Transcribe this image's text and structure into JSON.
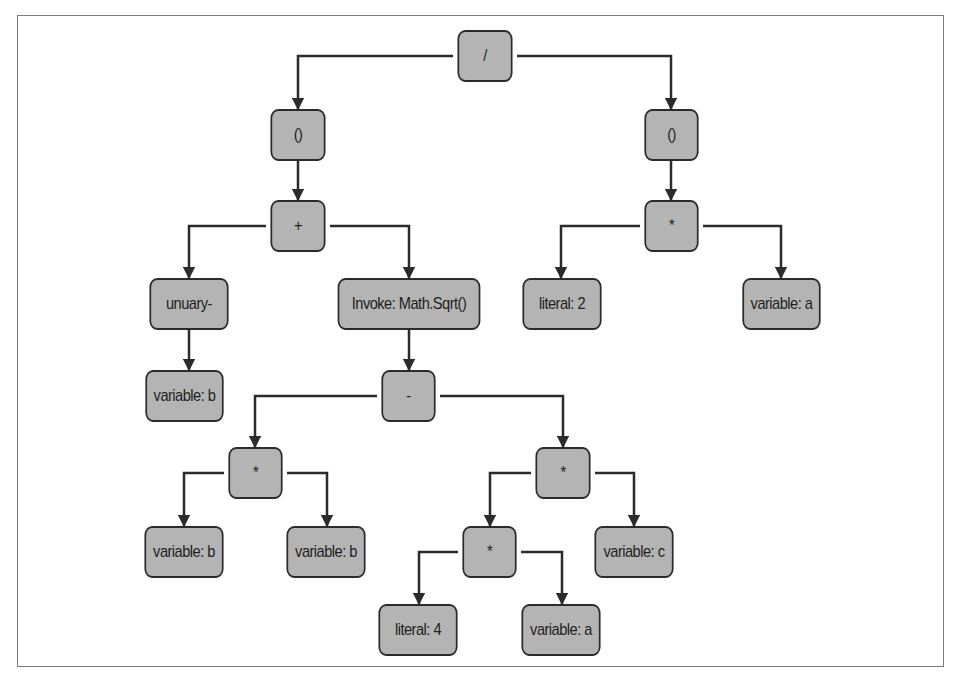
{
  "diagram": {
    "type": "expression-tree",
    "nodes": [
      {
        "id": "root",
        "label": "/",
        "x": 453,
        "y": 30,
        "w": 64,
        "h": 52
      },
      {
        "id": "paren-left",
        "label": "()",
        "x": 266,
        "y": 109,
        "w": 64,
        "h": 52
      },
      {
        "id": "paren-right",
        "label": "()",
        "x": 640,
        "y": 109,
        "w": 63,
        "h": 52
      },
      {
        "id": "plus",
        "label": "+",
        "x": 266,
        "y": 200,
        "w": 64,
        "h": 52
      },
      {
        "id": "mult-right-top",
        "label": "*",
        "x": 640,
        "y": 200,
        "w": 63,
        "h": 52
      },
      {
        "id": "unary-minus",
        "label": "unuary-",
        "x": 143,
        "y": 278,
        "w": 92,
        "h": 52
      },
      {
        "id": "invoke-sqrt",
        "label": "Invoke: Math.Sqrt()",
        "x": 326,
        "y": 278,
        "w": 166,
        "h": 52
      },
      {
        "id": "literal-2",
        "label": "literal: 2",
        "x": 516,
        "y": 278,
        "w": 92,
        "h": 52
      },
      {
        "id": "variable-a-top",
        "label": "variable: a",
        "x": 736,
        "y": 278,
        "w": 91,
        "h": 52
      },
      {
        "id": "variable-b-unary",
        "label": "variable: b",
        "x": 139,
        "y": 370,
        "w": 91,
        "h": 52
      },
      {
        "id": "minus",
        "label": "-",
        "x": 377,
        "y": 370,
        "w": 63,
        "h": 52
      },
      {
        "id": "mult-bb",
        "label": "*",
        "x": 224,
        "y": 447,
        "w": 63,
        "h": 52
      },
      {
        "id": "mult-4ac",
        "label": "*",
        "x": 531,
        "y": 447,
        "w": 64,
        "h": 52
      },
      {
        "id": "variable-b-1",
        "label": "variable: b",
        "x": 138,
        "y": 526,
        "w": 92,
        "h": 52
      },
      {
        "id": "variable-b-2",
        "label": "variable: b",
        "x": 280,
        "y": 526,
        "w": 92,
        "h": 52
      },
      {
        "id": "mult-4a",
        "label": "*",
        "x": 458,
        "y": 526,
        "w": 63,
        "h": 52
      },
      {
        "id": "variable-c",
        "label": "variable: c",
        "x": 588,
        "y": 526,
        "w": 92,
        "h": 52
      },
      {
        "id": "literal-4",
        "label": "literal: 4",
        "x": 372,
        "y": 604,
        "w": 92,
        "h": 52
      },
      {
        "id": "variable-a-bottom",
        "label": "variable: a",
        "x": 515,
        "y": 604,
        "w": 92,
        "h": 52
      }
    ],
    "edges": [
      {
        "from": "root",
        "to": "paren-left",
        "path": "M453,56 H298 V109"
      },
      {
        "from": "root",
        "to": "paren-right",
        "path": "M517,56 H671 V109"
      },
      {
        "from": "paren-left",
        "to": "plus",
        "path": "M298,161 V200"
      },
      {
        "from": "paren-right",
        "to": "mult-right-top",
        "path": "M671,161 V200"
      },
      {
        "from": "plus",
        "to": "unary-minus",
        "path": "M266,226 H189 V278"
      },
      {
        "from": "plus",
        "to": "invoke-sqrt",
        "path": "M330,226 H409 V278"
      },
      {
        "from": "mult-right-top",
        "to": "literal-2",
        "path": "M640,226 H561 V278"
      },
      {
        "from": "mult-right-top",
        "to": "variable-a-top",
        "path": "M703,226 H781 V278"
      },
      {
        "from": "unary-minus",
        "to": "variable-b-unary",
        "path": "M189,330 V370"
      },
      {
        "from": "invoke-sqrt",
        "to": "minus",
        "path": "M409,330 V370"
      },
      {
        "from": "minus",
        "to": "mult-bb",
        "path": "M377,396 H255 V447"
      },
      {
        "from": "minus",
        "to": "mult-4ac",
        "path": "M440,396 H563 V447"
      },
      {
        "from": "mult-bb",
        "to": "variable-b-1",
        "path": "M224,473 H184 V526"
      },
      {
        "from": "mult-bb",
        "to": "variable-b-2",
        "path": "M287,473 H327 V526"
      },
      {
        "from": "mult-4ac",
        "to": "mult-4a",
        "path": "M531,473 H490 V526"
      },
      {
        "from": "mult-4ac",
        "to": "variable-c",
        "path": "M595,473 H634 V526"
      },
      {
        "from": "mult-4a",
        "to": "literal-4",
        "path": "M458,552 H419 V604"
      },
      {
        "from": "mult-4a",
        "to": "variable-a-bottom",
        "path": "M521,552 H562 V604"
      }
    ]
  },
  "colors": {
    "node_fill": "#b4b4b4",
    "node_border": "#2b2b2b",
    "edge": "#2b2b2b",
    "frame": "#7a7a7a",
    "background": "#ffffff"
  }
}
